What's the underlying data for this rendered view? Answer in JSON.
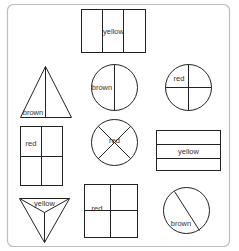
{
  "colors": {
    "stroke": "#222222",
    "frame": "#bdbdbd",
    "text": "#333333",
    "background": "#ffffff"
  },
  "shapes": [
    {
      "id": "rect-thirds",
      "shape": "rectangle",
      "parts": 3,
      "label": "yellow"
    },
    {
      "id": "triangle-halves",
      "shape": "triangle",
      "parts": 2,
      "label": "brown"
    },
    {
      "id": "circle-halves",
      "shape": "circle",
      "parts": 2,
      "label": "brown"
    },
    {
      "id": "circle-quarters",
      "shape": "circle",
      "parts": 4,
      "label": "red"
    },
    {
      "id": "rect-quarters",
      "shape": "rectangle",
      "parts": 4,
      "label": "red"
    },
    {
      "id": "circle-x-quarters",
      "shape": "circle",
      "parts": 4,
      "label": "red"
    },
    {
      "id": "rect-horizontal-thirds",
      "shape": "rectangle",
      "parts": 3,
      "label": "yellow"
    },
    {
      "id": "triangle-thirds",
      "shape": "triangle",
      "parts": 3,
      "label": "yellow"
    },
    {
      "id": "square-quarters",
      "shape": "square",
      "parts": 4,
      "label": "red"
    },
    {
      "id": "circle-unequal-halves",
      "shape": "circle",
      "parts": 2,
      "label": "brown"
    }
  ]
}
